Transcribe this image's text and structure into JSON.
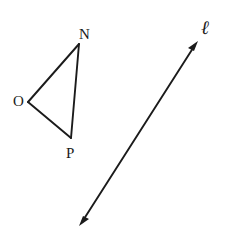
{
  "figure": {
    "background_color": "#ffffff",
    "stroke_color": "#1b1b1b",
    "canvas": {
      "width": 228,
      "height": 236
    },
    "triangle": {
      "name": "triangle-onp",
      "vertices": [
        {
          "label": "N",
          "x": 79,
          "y": 44,
          "label_x": 79,
          "label_y": 27
        },
        {
          "label": "O",
          "x": 28,
          "y": 102,
          "label_x": 13,
          "label_y": 94
        },
        {
          "label": "P",
          "x": 71,
          "y": 138,
          "label_x": 66,
          "label_y": 146
        }
      ],
      "edges": [
        {
          "name": "edge-on",
          "from": "O",
          "to": "N"
        },
        {
          "name": "edge-np",
          "from": "N",
          "to": "P"
        },
        {
          "name": "edge-op",
          "from": "O",
          "to": "P"
        }
      ],
      "stroke_width": 1.8
    },
    "line": {
      "name": "line-l",
      "label": "ℓ",
      "label_x": 201,
      "label_y": 18,
      "start": {
        "x": 81,
        "y": 223
      },
      "end": {
        "x": 196,
        "y": 44
      },
      "arrowheads": "both",
      "stroke_width": 1.8
    }
  }
}
